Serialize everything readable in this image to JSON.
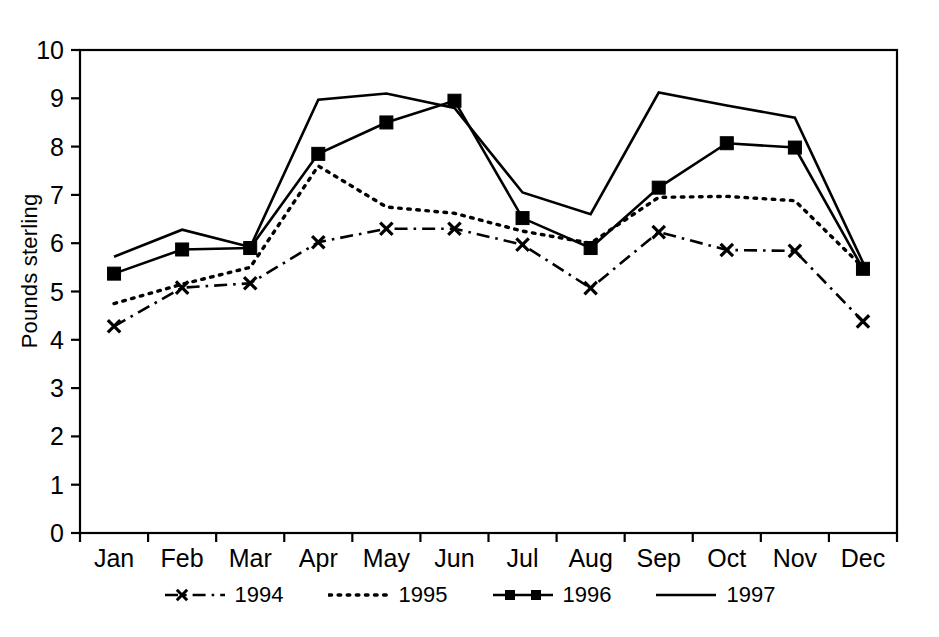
{
  "chart_data": {
    "type": "line",
    "title": "",
    "xlabel": "",
    "ylabel": "Pounds sterling",
    "categories": [
      "Jan",
      "Feb",
      "Mar",
      "Apr",
      "May",
      "Jun",
      "Jul",
      "Aug",
      "Sep",
      "Oct",
      "Nov",
      "Dec"
    ],
    "ylim": [
      0,
      10
    ],
    "ytick_step": 1,
    "yticks": [
      "0",
      "1",
      "2",
      "3",
      "4",
      "5",
      "6",
      "7",
      "8",
      "9",
      "10"
    ],
    "grid": false,
    "legend_position": "bottom-center",
    "series": [
      {
        "name": "1994",
        "style": "dash-dot",
        "marker": "x",
        "color": "#000000",
        "values": [
          4.28,
          5.08,
          5.17,
          6.02,
          6.3,
          6.3,
          5.97,
          5.07,
          6.23,
          5.86,
          5.84,
          4.38
        ]
      },
      {
        "name": "1995",
        "style": "dotted",
        "marker": "none",
        "color": "#000000",
        "values": [
          4.75,
          5.15,
          5.5,
          7.6,
          6.75,
          6.62,
          6.25,
          6.0,
          6.95,
          6.97,
          6.88,
          5.5
        ]
      },
      {
        "name": "1996",
        "style": "solid",
        "marker": "square",
        "color": "#000000",
        "values": [
          5.37,
          5.87,
          5.9,
          7.85,
          8.5,
          8.95,
          6.52,
          5.9,
          7.15,
          8.07,
          7.98,
          5.47
        ]
      },
      {
        "name": "1997",
        "style": "solid",
        "marker": "none",
        "color": "#000000",
        "values": [
          5.72,
          6.28,
          5.92,
          8.97,
          9.1,
          8.8,
          7.05,
          6.6,
          9.12,
          8.85,
          8.6,
          5.6
        ]
      }
    ]
  },
  "axis": {
    "y_title": "Pounds sterling"
  },
  "legend": {
    "items": [
      {
        "label": "1994",
        "key": "dash-dot-x-marker"
      },
      {
        "label": "1995",
        "key": "dotted"
      },
      {
        "label": "1996",
        "key": "solid-square-marker"
      },
      {
        "label": "1997",
        "key": "solid"
      }
    ]
  }
}
